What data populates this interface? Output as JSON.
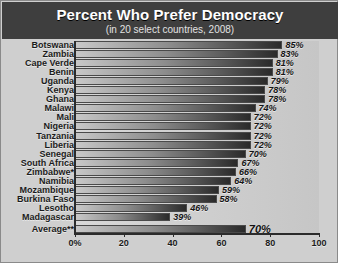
{
  "header": {
    "title": "Percent Who Prefer Democracy",
    "subtitle": "(in 20 select countries, 2008)",
    "background": "#3e3e3e",
    "title_color": "#ffffff"
  },
  "axis": {
    "ticks": [
      "0%",
      "20",
      "40",
      "60",
      "80",
      "100"
    ],
    "tick_values": [
      0,
      20,
      40,
      60,
      80,
      100
    ]
  },
  "chart_data": {
    "type": "bar",
    "orientation": "horizontal",
    "title": "Percent Who Prefer Democracy",
    "subtitle": "(in 20 select countries, 2008)",
    "xlabel": "",
    "ylabel": "",
    "xlim": [
      0,
      100
    ],
    "grid": false,
    "legend": null,
    "categories": [
      "Botswana",
      "Zambia",
      "Cape Verde",
      "Benin",
      "Uganda",
      "Kenya",
      "Ghana",
      "Malawi",
      "Mali",
      "Nigeria",
      "Tanzania",
      "Liberia",
      "Senegal",
      "South Africa",
      "Zimbabwe*",
      "Namibia",
      "Mozambique",
      "Burkina Faso",
      "Lesotho",
      "Madagascar"
    ],
    "values": [
      85,
      83,
      81,
      81,
      79,
      78,
      78,
      74,
      72,
      72,
      72,
      72,
      70,
      67,
      66,
      64,
      59,
      58,
      46,
      39
    ],
    "value_labels": [
      "85%",
      "83%",
      "81%",
      "81%",
      "79%",
      "78%",
      "78%",
      "74%",
      "72%",
      "72%",
      "72%",
      "72%",
      "70%",
      "67%",
      "66%",
      "64%",
      "59%",
      "58%",
      "46%",
      "39%"
    ],
    "summary": {
      "category": "Average**",
      "value": 70,
      "label": "70%"
    },
    "bar_color": "#5e5e5e",
    "background_color": "#cfcfcf"
  }
}
